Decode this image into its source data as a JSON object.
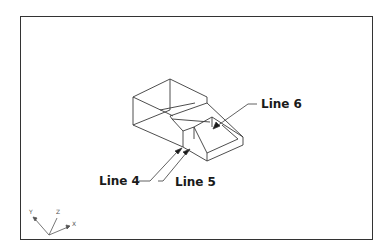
{
  "drawing": {
    "title": "Isometric wireframe part with labeled edges",
    "labels": {
      "line4": "Line 4",
      "line5": "Line 5",
      "line6": "Line 6"
    },
    "ucs_icon": {
      "x": "X",
      "y": "Y",
      "z": "Z"
    },
    "colors": {
      "line": "#333333",
      "frame": "#333333",
      "background": "#ffffff"
    }
  }
}
